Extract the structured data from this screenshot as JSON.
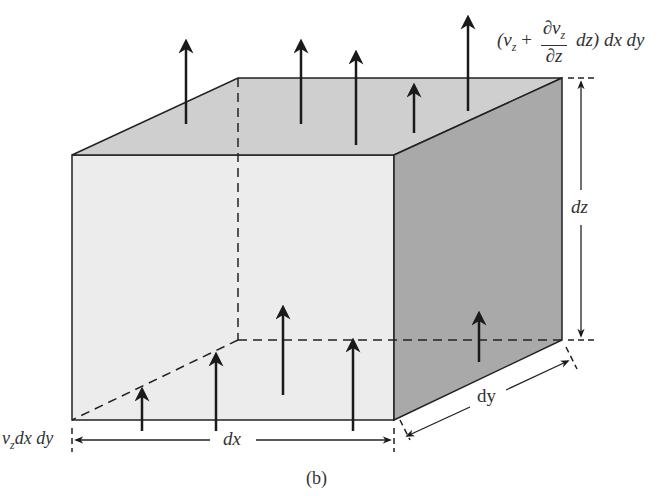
{
  "diagram": {
    "caption": "(b)",
    "labels": {
      "top_flux_prefix": "(v",
      "top_flux_sub": "z",
      "top_flux_plus": " +",
      "top_flux_frac_num": "∂v",
      "top_flux_frac_num_sub": "z",
      "top_flux_frac_den": "∂z",
      "top_flux_suffix": "dz) dx dy",
      "bottom_flux_v": "v",
      "bottom_flux_sub": "z",
      "bottom_flux_rest": "dx dy",
      "dx": "dx",
      "dy": "dy",
      "dz": "dz"
    },
    "colors": {
      "front_face": "#ececec",
      "top_face": "#cfcfcf",
      "side_face": "#a9a9a9",
      "lines": "#222222",
      "arrows": "#1a1a1a"
    }
  }
}
